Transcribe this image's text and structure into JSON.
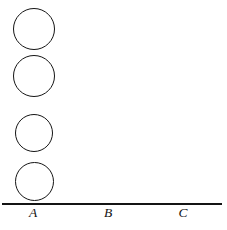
{
  "figure": {
    "kind": "tower-of-hanoi-diagram",
    "background_color": "#ffffff",
    "stroke_color": "#141414"
  },
  "baseline": {
    "label": "baseline",
    "x_start": 2,
    "x_end": 222,
    "y": 203,
    "thickness": 2,
    "color": "#141414"
  },
  "pegs": [
    {
      "label": "A",
      "x": 33,
      "disk_count": 4
    },
    {
      "label": "B",
      "x": 108,
      "disk_count": 0
    },
    {
      "label": "C",
      "x": 183,
      "disk_count": 0
    }
  ],
  "disks": [
    {
      "index": 1,
      "peg": "A",
      "center_x": 34,
      "center_y": 29,
      "diameter": 42,
      "filled": false
    },
    {
      "index": 2,
      "peg": "A",
      "center_x": 34,
      "center_y": 76,
      "diameter": 42,
      "filled": false
    },
    {
      "index": 3,
      "peg": "A",
      "center_x": 34,
      "center_y": 133,
      "diameter": 38,
      "filled": false
    },
    {
      "index": 4,
      "peg": "A",
      "center_x": 34,
      "center_y": 181,
      "diameter": 39,
      "filled": false
    }
  ]
}
